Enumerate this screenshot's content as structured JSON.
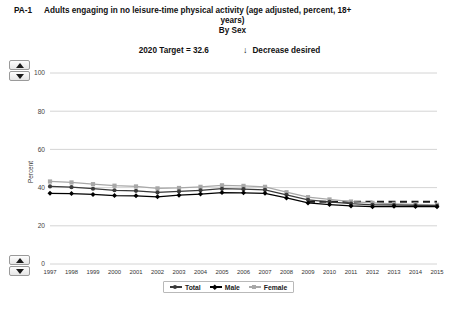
{
  "header": {
    "indicator_code": "PA-1",
    "title_line1": "Adults engaging in no leisure-time physical activity (age adjusted, percent, 18+",
    "title_line2": "years)",
    "title_line3": "By Sex",
    "target_label": "2020 Target = 32.6",
    "direction_arrow": "↓",
    "direction_label": "Decrease desired"
  },
  "spinners": {
    "up_icon": "triangle-up-icon",
    "down_icon": "triangle-down-icon"
  },
  "legend": {
    "position": "bottom-center",
    "items": [
      {
        "label": "Total",
        "color": "#3a3a3a",
        "marker": "circle"
      },
      {
        "label": "Male",
        "color": "#000000",
        "marker": "diamond"
      },
      {
        "label": "Female",
        "color": "#a8a8a8",
        "marker": "square"
      }
    ]
  },
  "chart_data": {
    "type": "line",
    "title": "Adults engaging in no leisure-time physical activity (age adjusted, percent, 18+ years)",
    "subtitle": "By Sex",
    "xlabel": "",
    "ylabel": "Percent",
    "ylim": [
      0,
      100
    ],
    "yticks": [
      0,
      20,
      40,
      60,
      80,
      100
    ],
    "grid": true,
    "categories": [
      "1997",
      "1998",
      "1999",
      "2000",
      "2001",
      "2002",
      "2003",
      "2004",
      "2005",
      "2006",
      "2007",
      "2008",
      "2009",
      "2010",
      "2011",
      "2012",
      "2013",
      "2014",
      "2015"
    ],
    "series": [
      {
        "name": "Total",
        "color": "#3a3a3a",
        "marker": "circle",
        "values": [
          40.6,
          40.2,
          39.4,
          38.6,
          38.3,
          37.5,
          38.0,
          38.6,
          39.4,
          39.2,
          38.8,
          36.2,
          33.6,
          32.5,
          31.6,
          31.0,
          30.9,
          30.7,
          30.5
        ]
      },
      {
        "name": "Male",
        "color": "#000000",
        "marker": "diamond",
        "values": [
          37.0,
          36.9,
          36.4,
          35.8,
          35.7,
          35.2,
          36.0,
          36.6,
          37.4,
          37.3,
          37.0,
          34.6,
          32.0,
          31.1,
          30.4,
          30.0,
          30.2,
          30.1,
          30.0
        ]
      },
      {
        "name": "Female",
        "color": "#a8a8a8",
        "marker": "square",
        "values": [
          43.2,
          42.7,
          41.8,
          41.0,
          40.6,
          39.6,
          39.8,
          40.4,
          41.2,
          40.9,
          40.4,
          37.6,
          35.0,
          33.8,
          32.7,
          32.0,
          31.5,
          31.2,
          31.0
        ]
      }
    ],
    "target_line": {
      "label": "2020 Target = 32.6",
      "value": 32.6,
      "style": "dashed",
      "color": "#1a1a1a",
      "start_category": "2009",
      "end_category": "2015"
    }
  }
}
